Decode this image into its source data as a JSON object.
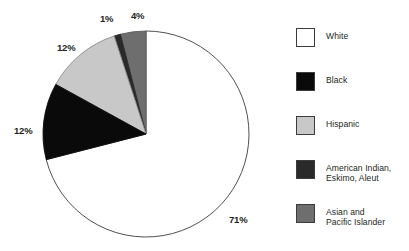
{
  "chart_data": {
    "type": "pie",
    "title": "",
    "subtitle": "",
    "xlabel": "",
    "ylabel": "",
    "legend_position": "right",
    "grid": false,
    "start_angle_deg": 90,
    "direction": "counterclockwise-for-minority-slices",
    "units": "percent",
    "categories": [
      "White",
      "Black",
      "Hispanic",
      "American Indian, Eskimo, Aleut",
      "Asian and Pacific Islander"
    ],
    "values": [
      71,
      12,
      12,
      1,
      4
    ],
    "labels": [
      "71%",
      "12%",
      "12%",
      "1%",
      "4%"
    ],
    "slices": [
      {
        "name": "White",
        "value": 71,
        "label": "71%",
        "color": "#ffffff",
        "stroke": "#3c3c3c",
        "label_x": 229,
        "label_y": 215
      },
      {
        "name": "Black",
        "value": 12,
        "label": "12%",
        "color": "#0a0a0a",
        "stroke": "#0a0a0a",
        "label_x": 14,
        "label_y": 126
      },
      {
        "name": "Hispanic",
        "value": 12,
        "label": "12%",
        "color": "#c8c8c8",
        "stroke": "#8a8a8a",
        "label_x": 57,
        "label_y": 43
      },
      {
        "name": "American Indian, Eskimo, Aleut",
        "value": 1,
        "label": "1%",
        "color": "#2a2a2a",
        "stroke": "#2a2a2a",
        "label_x": 100,
        "label_y": 14
      },
      {
        "name": "Asian and Pacific Islander",
        "value": 4,
        "label": "4%",
        "color": "#6e6e6e",
        "stroke": "#5a5a5a",
        "label_x": 131,
        "label_y": 11
      }
    ],
    "geometry": {
      "center_x": 146,
      "center_y": 134,
      "radius": 103
    }
  },
  "legend": {
    "items": [
      {
        "label": "White",
        "color": "#ffffff",
        "top": 0
      },
      {
        "label": "Black",
        "color": "#0a0a0a",
        "top": 44
      },
      {
        "label": "Hispanic",
        "color": "#c8c8c8",
        "top": 88
      },
      {
        "label": "American Indian,\nEskimo, Aleut",
        "color": "#2a2a2a",
        "top": 132
      },
      {
        "label": "Asian and\nPacific Islander",
        "color": "#6e6e6e",
        "top": 176
      }
    ]
  }
}
